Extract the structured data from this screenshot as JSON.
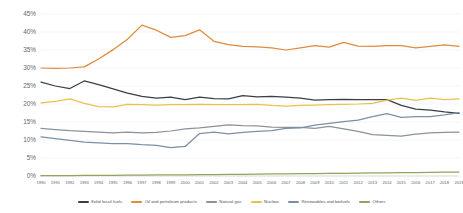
{
  "chart_data": {
    "type": "line",
    "title": "",
    "subtitle": "",
    "xlabel": "",
    "ylabel": "",
    "ylim": [
      0,
      45
    ],
    "ytick_labels": [
      "0%",
      "5%",
      "10%",
      "15%",
      "20%",
      "25%",
      "30%",
      "35%",
      "40%",
      "45%"
    ],
    "ytick_values": [
      0,
      5,
      10,
      15,
      20,
      25,
      30,
      35,
      40,
      45
    ],
    "grid": true,
    "legend_position": "bottom",
    "categories": [
      "1990",
      "1991",
      "1992",
      "1993",
      "1994",
      "1995",
      "1996",
      "1997",
      "1998",
      "1999",
      "2000",
      "2001",
      "2002",
      "2003",
      "2004",
      "2005",
      "2006",
      "2007",
      "2008",
      "2009",
      "2010",
      "2011",
      "2012",
      "2013",
      "2014",
      "2015",
      "2016",
      "2017",
      "2018",
      "2019"
    ],
    "series": [
      {
        "name": "Solid fossil fuels",
        "color": "#3b3f44",
        "values": [
          26.1,
          25.0,
          24.3,
          26.4,
          25.4,
          24.2,
          23.0,
          22.1,
          21.6,
          21.9,
          21.2,
          21.9,
          21.5,
          21.4,
          22.3,
          22.0,
          22.1,
          21.9,
          21.6,
          21.1,
          21.2,
          21.3,
          21.2,
          21.2,
          21.2,
          19.6,
          18.6,
          18.3,
          17.8,
          17.4
        ]
      },
      {
        "name": "Oil and petroleum products",
        "color": "#e08a3c",
        "values": [
          30.0,
          29.9,
          30.0,
          30.3,
          32.5,
          35.1,
          38.0,
          41.9,
          40.5,
          38.5,
          39.0,
          40.6,
          37.4,
          36.5,
          36.0,
          35.9,
          35.6,
          35.0,
          35.6,
          36.2,
          35.8,
          37.1,
          36.1,
          36.0,
          36.2,
          36.2,
          35.6,
          36.0,
          36.4,
          36.0
        ]
      },
      {
        "name": "Natural gas",
        "color": "#8b9299",
        "values": [
          13.2,
          12.9,
          12.6,
          12.4,
          12.2,
          12.0,
          12.2,
          12.0,
          12.1,
          12.5,
          13.1,
          13.4,
          13.8,
          14.2,
          14.0,
          13.9,
          13.6,
          13.5,
          13.5,
          13.2,
          13.8,
          13.1,
          12.4,
          11.5,
          11.3,
          11.1,
          11.6,
          12.0,
          12.1,
          12.2
        ]
      },
      {
        "name": "Nuclear",
        "color": "#e8c24a",
        "values": [
          20.3,
          20.7,
          21.4,
          20.2,
          19.3,
          19.2,
          19.9,
          19.8,
          19.7,
          19.8,
          19.8,
          19.9,
          19.8,
          19.8,
          19.8,
          19.9,
          19.6,
          19.4,
          19.6,
          19.7,
          19.8,
          19.9,
          20.0,
          20.2,
          21.1,
          21.6,
          21.0,
          21.6,
          21.2,
          21.4
        ]
      },
      {
        "name": "Renewables and biofuels",
        "color": "#7b90a8",
        "values": [
          10.9,
          10.4,
          9.9,
          9.4,
          9.2,
          9.0,
          9.0,
          8.7,
          8.5,
          7.9,
          8.2,
          11.8,
          12.2,
          11.7,
          12.1,
          12.4,
          12.6,
          13.2,
          13.4,
          14.1,
          14.6,
          15.1,
          15.5,
          16.5,
          17.3,
          16.3,
          16.5,
          16.5,
          17.0,
          17.6
        ]
      },
      {
        "name": "Others",
        "color": "#8fa55c",
        "values": [
          0.1,
          0.12,
          0.14,
          0.16,
          0.18,
          0.2,
          0.22,
          0.25,
          0.28,
          0.3,
          0.33,
          0.36,
          0.4,
          0.44,
          0.48,
          0.52,
          0.56,
          0.6,
          0.64,
          0.68,
          0.72,
          0.76,
          0.8,
          0.84,
          0.88,
          0.92,
          0.96,
          1.0,
          1.05,
          1.1
        ]
      }
    ]
  }
}
